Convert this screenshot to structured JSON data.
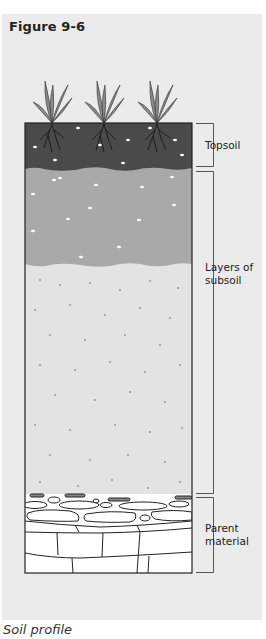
{
  "figure": {
    "title": "Figure 9-6",
    "caption": "Soil profile"
  },
  "layers": [
    {
      "name": "Topsoil",
      "label_lines": [
        "Topsoil"
      ],
      "color": "#4a4a4a",
      "top": 123,
      "bottom": 170
    },
    {
      "name": "Layers of subsoil",
      "label_lines": [
        "Layers of",
        "subsoil"
      ],
      "sublayers": [
        {
          "color": "#a9a9a9",
          "top": 170,
          "bottom": 266
        },
        {
          "color": "#e3e3e3",
          "top": 266,
          "bottom": 494
        }
      ]
    },
    {
      "name": "Parent material",
      "label_lines": [
        "Parent",
        "material"
      ],
      "color": "#ffffff",
      "top": 494,
      "bottom": 573
    }
  ],
  "labels": {
    "topsoil": "Topsoil",
    "subsoil_line1": "Layers of",
    "subsoil_line2": "subsoil",
    "parent_line1": "Parent",
    "parent_line2": "material"
  },
  "plants": {
    "count": 3,
    "centers_x": [
      52,
      104,
      157
    ]
  }
}
